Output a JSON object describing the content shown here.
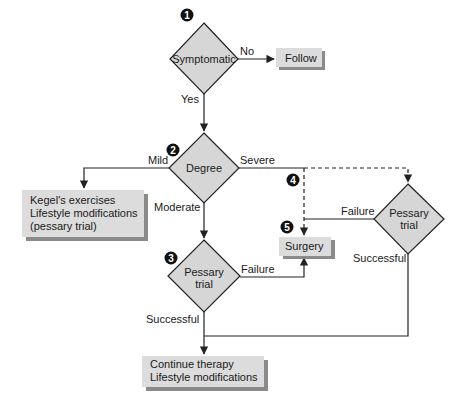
{
  "diagram": {
    "type": "clinical-flowchart",
    "colors": {
      "node_fill": "#d6d6d6",
      "node_stroke": "#222222",
      "box_shadow": "#8a8a8a",
      "line": "#222222",
      "badge": "#111111"
    },
    "nodes": {
      "symptomatic": {
        "label": "Symptomatic",
        "shape": "diamond",
        "badge": "1"
      },
      "follow": {
        "label": "Follow",
        "shape": "box"
      },
      "degree": {
        "label": "Degree",
        "shape": "diamond",
        "badge": "2"
      },
      "kegel": {
        "shape": "box",
        "lines": [
          "Kegel's exercises",
          "Lifestyle modifications",
          "(pessary trial)"
        ]
      },
      "pessary_moderate": {
        "lines": [
          "Pessary",
          "trial"
        ],
        "shape": "diamond",
        "badge": "3"
      },
      "surgery": {
        "label": "Surgery",
        "shape": "box",
        "badge": "5"
      },
      "pessary_severe": {
        "lines": [
          "Pessary",
          "trial"
        ],
        "shape": "diamond"
      },
      "continue": {
        "shape": "box",
        "lines": [
          "Continue therapy",
          "Lifestyle modifications"
        ]
      }
    },
    "badges": {
      "severe_branch": "4"
    },
    "edges": {
      "no": "No",
      "yes": "Yes",
      "mild": "Mild",
      "moderate": "Moderate",
      "severe": "Severe",
      "failure_moderate": "Failure",
      "failure_severe": "Failure",
      "successful_moderate": "Successful",
      "successful_severe": "Successful"
    }
  }
}
